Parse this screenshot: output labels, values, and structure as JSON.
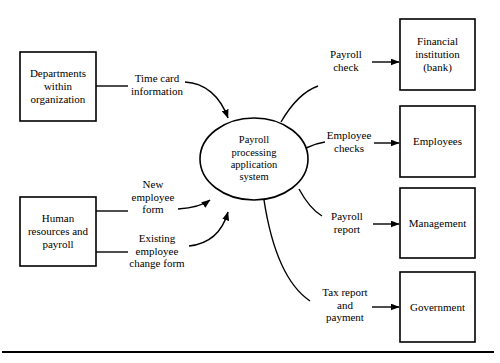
{
  "diagram": {
    "type": "data-flow-diagram",
    "background_color": "#ffffff",
    "stroke_color": "#000000",
    "process": {
      "shape": "ellipse",
      "label": "Payroll\nprocessing\napplication\nsystem",
      "lines": [
        "Payroll",
        "processing",
        "application",
        "system"
      ]
    },
    "external_entities": [
      {
        "id": "departments",
        "label_lines": [
          "Departments",
          "within",
          "organization"
        ],
        "side": "left"
      },
      {
        "id": "human-resources",
        "label_lines": [
          "Human",
          "resources and",
          "payroll"
        ],
        "side": "left"
      },
      {
        "id": "financial-institution",
        "label_lines": [
          "Financial",
          "institution",
          "(bank)"
        ],
        "side": "right"
      },
      {
        "id": "employees",
        "label_lines": [
          "Employees"
        ],
        "side": "right"
      },
      {
        "id": "management",
        "label_lines": [
          "Management"
        ],
        "side": "right"
      },
      {
        "id": "government",
        "label_lines": [
          "Government"
        ],
        "side": "right"
      }
    ],
    "data_flows": [
      {
        "id": "time-card-information",
        "label_lines": [
          "Time card",
          "information"
        ],
        "from": "departments",
        "to": "process"
      },
      {
        "id": "new-employee-form",
        "label_lines": [
          "New",
          "employee",
          "form"
        ],
        "from": "human-resources",
        "to": "process"
      },
      {
        "id": "existing-employee-change-form",
        "label_lines": [
          "Existing",
          "employee",
          "change form"
        ],
        "from": "human-resources",
        "to": "process"
      },
      {
        "id": "payroll-check",
        "label_lines": [
          "Payroll",
          "check"
        ],
        "from": "process",
        "to": "financial-institution"
      },
      {
        "id": "employee-checks",
        "label_lines": [
          "Employee",
          "checks"
        ],
        "from": "process",
        "to": "employees"
      },
      {
        "id": "payroll-report",
        "label_lines": [
          "Payroll",
          "report"
        ],
        "from": "process",
        "to": "management"
      },
      {
        "id": "tax-report-and-payment",
        "label_lines": [
          "Tax report",
          "and",
          "payment"
        ],
        "from": "process",
        "to": "government"
      }
    ]
  }
}
